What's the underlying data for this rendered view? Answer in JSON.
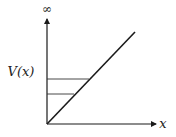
{
  "diagram": {
    "type": "potential-energy-diagram",
    "y_axis": {
      "label": "V(x)",
      "top_symbol": "∞"
    },
    "x_axis": {
      "label": "x"
    },
    "curve": {
      "description": "linear potential V(x) rising from origin",
      "shape": "straight-line"
    },
    "energy_levels": [
      {
        "name": "upper-level"
      },
      {
        "name": "lower-level"
      }
    ],
    "colors": {
      "line": "#1a1a1a",
      "level": "#333333",
      "background": "#ffffff"
    }
  }
}
